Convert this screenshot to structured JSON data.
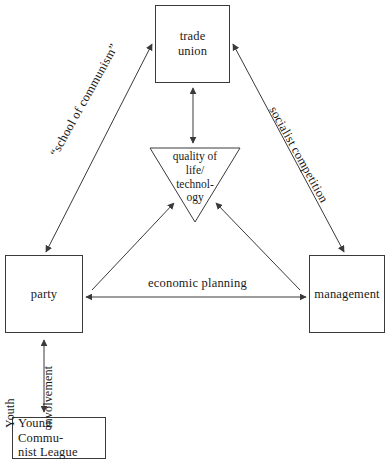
{
  "diagram": {
    "background_color": "#ffffff",
    "stroke_color": "#3a3a3a",
    "text_color": "#1a1a1a",
    "nodes": {
      "trade_union": {
        "label": "trade\nunion",
        "line1": "trade",
        "line2": "union",
        "shape": "rectangle"
      },
      "quality": {
        "label": "quality of life/technology",
        "line1": "quality of",
        "line2": "life/",
        "line3": "technol-",
        "line4": "ogy",
        "shape": "inverted-triangle"
      },
      "party": {
        "label": "party",
        "shape": "rectangle"
      },
      "management": {
        "label": "management",
        "shape": "rectangle"
      },
      "ycl": {
        "label": "Young Communist League",
        "line1": "Young Commu-",
        "line2": "nist League",
        "shape": "rectangle"
      }
    },
    "edges": {
      "party_trade_union": {
        "label": "“school of communism”",
        "arrows": "double"
      },
      "trade_union_management": {
        "label": "socialist competition",
        "arrows": "double"
      },
      "party_management": {
        "label": "economic planning",
        "arrows": "double"
      },
      "party_ycl": {
        "label_left": "Youth",
        "label_right": "involvement",
        "arrows": "double"
      },
      "trade_union_quality": {
        "label": "",
        "arrows": "double"
      },
      "party_quality": {
        "label": "",
        "arrows": "single"
      },
      "management_quality": {
        "label": "",
        "arrows": "single"
      }
    }
  }
}
